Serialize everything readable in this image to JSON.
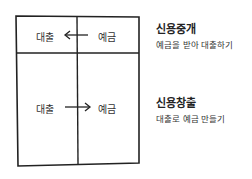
{
  "diagram": {
    "top_row": {
      "left_label": "대출",
      "right_label": "예금",
      "arrow_direction": "left"
    },
    "bottom_row": {
      "left_label": "대출",
      "right_label": "예금",
      "arrow_direction": "right"
    }
  },
  "annotations": [
    {
      "title": "신용중개",
      "description": "예금을 받아 대출하기"
    },
    {
      "title": "신용창출",
      "description": "대출로 예금 만들기"
    }
  ],
  "colors": {
    "stroke": "#222222",
    "background": "#ffffff"
  }
}
